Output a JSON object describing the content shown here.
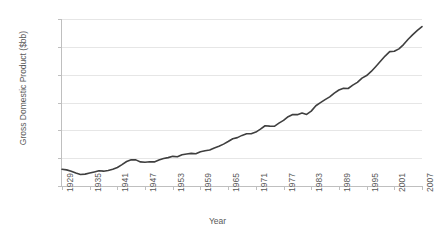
{
  "chart_data": {
    "type": "line",
    "title": "",
    "xlabel": "Year",
    "ylabel": "Gross Domestic Product ($bb)",
    "xlim": [
      1929,
      2007
    ],
    "ylim": [
      0,
      12000
    ],
    "y_ticks": [
      "0",
      "2,000",
      "4,000",
      "6,000",
      "8,000",
      "10,000",
      "12,000"
    ],
    "y_tick_values": [
      0,
      2000,
      4000,
      6000,
      8000,
      10000,
      12000
    ],
    "x_ticks": [
      "1929",
      "1935",
      "1941",
      "1947",
      "1953",
      "1959",
      "1965",
      "1971",
      "1977",
      "1983",
      "1989",
      "1995",
      "2001",
      "2007"
    ],
    "x_tick_values": [
      1929,
      1935,
      1941,
      1947,
      1953,
      1959,
      1965,
      1971,
      1977,
      1983,
      1989,
      1995,
      2001,
      2007
    ],
    "grid": "horizontal",
    "legend": "none",
    "line_color": "#3f3f3f",
    "grid_color": "#e6e6e6",
    "axis_color": "#bfbfbf",
    "series": [
      {
        "name": "Gross Domestic Product",
        "x": [
          1929,
          1930,
          1931,
          1932,
          1933,
          1934,
          1935,
          1936,
          1937,
          1938,
          1939,
          1940,
          1941,
          1942,
          1943,
          1944,
          1945,
          1946,
          1947,
          1948,
          1949,
          1950,
          1951,
          1952,
          1953,
          1954,
          1955,
          1956,
          1957,
          1958,
          1959,
          1960,
          1961,
          1962,
          1963,
          1964,
          1965,
          1966,
          1967,
          1968,
          1969,
          1970,
          1971,
          1972,
          1973,
          1974,
          1975,
          1976,
          1977,
          1978,
          1979,
          1980,
          1981,
          1982,
          1983,
          1984,
          1985,
          1986,
          1987,
          1988,
          1989,
          1990,
          1991,
          1992,
          1993,
          1994,
          1995,
          1996,
          1997,
          1998,
          1999,
          2000,
          2001,
          2002,
          2003,
          2004,
          2005,
          2006,
          2007
        ],
        "values": [
          900,
          870,
          800,
          700,
          620,
          640,
          700,
          760,
          820,
          800,
          840,
          900,
          1000,
          1150,
          1320,
          1420,
          1410,
          1300,
          1280,
          1310,
          1300,
          1400,
          1480,
          1530,
          1600,
          1580,
          1690,
          1730,
          1760,
          1740,
          1850,
          1900,
          1940,
          2050,
          2140,
          2260,
          2400,
          2550,
          2610,
          2730,
          2820,
          2820,
          2910,
          3070,
          3250,
          3230,
          3220,
          3390,
          3540,
          3740,
          3860,
          3850,
          3940,
          3860,
          4040,
          4330,
          4500,
          4660,
          4810,
          5010,
          5180,
          5270,
          5260,
          5440,
          5590,
          5820,
          5960,
          6180,
          6450,
          6730,
          7010,
          7250,
          7270,
          7400,
          7630,
          7920,
          8170,
          8400,
          8600
        ]
      }
    ],
    "series_display": [
      {
        "x": 1929,
        "y": 900
      },
      {
        "x": 1933,
        "y": 620
      },
      {
        "x": 1944,
        "y": 1420
      },
      {
        "x": 1947,
        "y": 1280
      },
      {
        "x": 1955,
        "y": 1690
      },
      {
        "x": 1965,
        "y": 2400
      },
      {
        "x": 1974,
        "y": 3230
      },
      {
        "x": 1979,
        "y": 3860
      },
      {
        "x": 1982,
        "y": 3860
      },
      {
        "x": 1990,
        "y": 5270
      },
      {
        "x": 1991,
        "y": 5260
      },
      {
        "x": 2000,
        "y": 9800
      },
      {
        "x": 2007,
        "y": 11500
      }
    ],
    "points_px": "900,870,800,700,620,640,700,760,820,800,840,900,1000,1150,1330,1430,1410,1300,1290,1320,1310,1410,1490,1540,1610,1590,1700,1740,1770,1750,1860,1910,1950,2060,2150,2270,2410,2560,2620,2740,2830,2830,2920,3080,3260,3240,3230,3400,3550,3750,3870,3860,3950,3870,4050,4340,4510,4670,4820,5020,5190,5280,5270,5450,5600,5830,5970,6190,6460,6740,7020,7260,7280,7410,7640,7930,8180,8410,8610"
  },
  "axes": {
    "y_axis_title": "Gross Domestic Product ($bb)",
    "x_axis_title": "Year"
  }
}
